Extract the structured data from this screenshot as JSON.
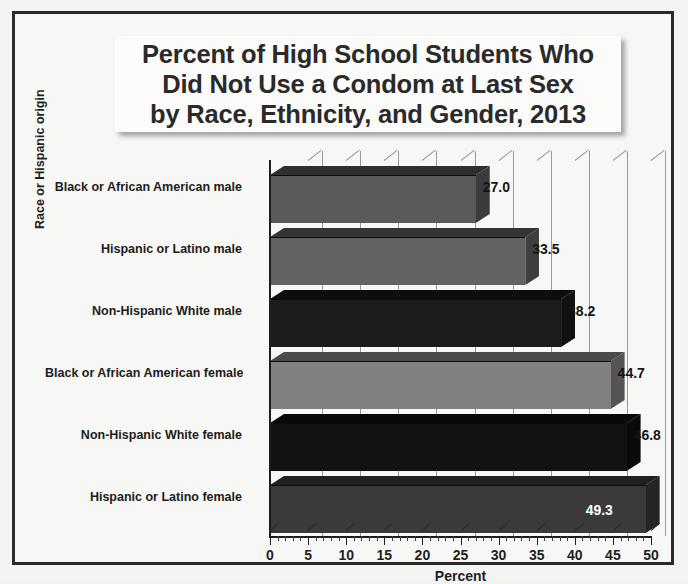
{
  "chart_data": {
    "type": "bar",
    "orientation": "horizontal",
    "title": "Percent of High School Students Who Did Not Use a Condom at Last Sex by Race, Ethnicity, and Gender, 2013",
    "title_lines": [
      "Percent of High School Students Who",
      "Did Not Use a Condom at Last Sex",
      "by Race, Ethnicity, and Gender, 2013"
    ],
    "xlabel": "Percent",
    "ylabel": "Race or Hispanic origin",
    "xlim": [
      0,
      50
    ],
    "xticks": [
      0,
      5,
      10,
      15,
      20,
      25,
      30,
      35,
      40,
      45,
      50
    ],
    "xtick_labels": [
      "0",
      "5",
      "10",
      "15",
      "20",
      "25",
      "30",
      "35",
      "40",
      "45",
      "50"
    ],
    "minor_tick_step": 1,
    "grid": true,
    "grid_axis": "x",
    "legend": false,
    "categories": [
      "Black or African American male",
      "Hispanic or Latino male",
      "Non-Hispanic White male",
      "Black or African American female",
      "Non-Hispanic White female",
      "Hispanic or Latino female"
    ],
    "values": [
      27.0,
      33.5,
      38.2,
      44.7,
      46.8,
      49.3
    ],
    "value_labels": [
      "27.0",
      "33.5",
      "38.2",
      "44.7",
      "46.8",
      "49.3"
    ],
    "bar_colors": [
      "#5a5a5a",
      "#626262",
      "#1c1c1c",
      "#808080",
      "#121212",
      "#3a3a3a"
    ],
    "bar_top_colors": [
      "#2f2f2f",
      "#343434",
      "#0d0d0d",
      "#4a4a4a",
      "#090909",
      "#202020"
    ],
    "bar_side_colors": [
      "#3b3b3b",
      "#3f3f3f",
      "#101010",
      "#545454",
      "#0a0a0a",
      "#252525"
    ],
    "label_inside_flags": [
      false,
      false,
      false,
      false,
      false,
      true
    ],
    "style": "3d-shaded-bars"
  },
  "colors": {
    "frame": "#2b2b2b",
    "page_background": "#f4f4f2",
    "title_box_background": "#fbfbfa",
    "text": "#1f1f1f",
    "gridline": "#9a9a9a",
    "axis": "#1d1d1d"
  }
}
